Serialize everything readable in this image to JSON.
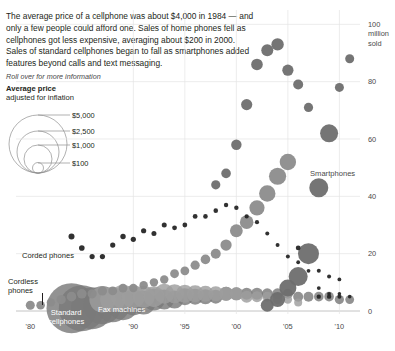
{
  "intro": {
    "paragraph": "The average price of a cellphone was about $4,000 in 1984 — and only a few people could afford one. Sales of home phones fell as cellphones got less expensive, averaging about $200 in 2000. Sales of standard cellphones began to fall as smartphones added features beyond calls and text messaging.",
    "rollover_hint": "Roll over for more information"
  },
  "legend": {
    "title": "Average price",
    "subtitle": "adjusted for inflation",
    "items": [
      {
        "label": "$5,000",
        "value": 5000
      },
      {
        "label": "$2,500",
        "value": 2500
      },
      {
        "label": "$1,000",
        "value": 1000
      },
      {
        "label": "$100",
        "value": 100
      }
    ]
  },
  "annotations": [
    {
      "name": "corded-phones",
      "label": "Corded phones"
    },
    {
      "name": "cordless-phones",
      "label": "Cordless\nphones"
    },
    {
      "name": "standard-cellphones",
      "label": "Standard\ncellphones"
    },
    {
      "name": "fax-machines",
      "label": "Fax machines"
    },
    {
      "name": "smartphones",
      "label": "Smartphones"
    }
  ],
  "colors": {
    "corded": "#262626",
    "cordless": "#8c8c8c",
    "standard_cellphones": "#7a7a7a",
    "fax": "#9e9e9e",
    "smartphones": "#6e6e6e",
    "grid": "#e4e4e4",
    "axis": "#b5b5b5",
    "text": "#231f20"
  },
  "chart_data": {
    "type": "scatter",
    "title": "",
    "xlabel": "",
    "ylabel": "million sold",
    "xlim": [
      1979,
      2012
    ],
    "ylim": [
      0,
      105
    ],
    "grid": true,
    "legend_position": "inline-annotations",
    "xticks": [
      {
        "value": 1980,
        "label": "'80"
      },
      {
        "value": 1990,
        "label": "'90"
      },
      {
        "value": 1995,
        "label": "'95"
      },
      {
        "value": 2000,
        "label": "'00"
      },
      {
        "value": 2005,
        "label": "'05"
      },
      {
        "value": 2010,
        "label": "'10"
      }
    ],
    "yticks": [
      {
        "value": 0,
        "label": "0"
      },
      {
        "value": 20,
        "label": "20"
      },
      {
        "value": 40,
        "label": "40"
      },
      {
        "value": 60,
        "label": "60"
      },
      {
        "value": 80,
        "label": "80"
      },
      {
        "value": 100,
        "label": "100"
      }
    ],
    "y_unit_lines": [
      "100",
      "million",
      "sold"
    ],
    "size_encoding": "average price adjusted for inflation (bubble area)",
    "series": [
      {
        "name": "Corded phones",
        "color": "#262626",
        "points": [
          {
            "x": 1984,
            "y": 26,
            "r": 3.0
          },
          {
            "x": 1985,
            "y": 22,
            "r": 2.8
          },
          {
            "x": 1986,
            "y": 19,
            "r": 2.6
          },
          {
            "x": 1987,
            "y": 19,
            "r": 2.6
          },
          {
            "x": 1988,
            "y": 23,
            "r": 2.6
          },
          {
            "x": 1989,
            "y": 26,
            "r": 2.7
          },
          {
            "x": 1990,
            "y": 25,
            "r": 2.6
          },
          {
            "x": 1991,
            "y": 28,
            "r": 2.6
          },
          {
            "x": 1992,
            "y": 27,
            "r": 2.5
          },
          {
            "x": 1993,
            "y": 30,
            "r": 2.5
          },
          {
            "x": 1994,
            "y": 29,
            "r": 2.4
          },
          {
            "x": 1995,
            "y": 30,
            "r": 2.4
          },
          {
            "x": 1996,
            "y": 33,
            "r": 2.4
          },
          {
            "x": 1997,
            "y": 33,
            "r": 2.3
          },
          {
            "x": 1998,
            "y": 35,
            "r": 2.3
          },
          {
            "x": 1999,
            "y": 37,
            "r": 2.2
          },
          {
            "x": 2000,
            "y": 36,
            "r": 2.2
          },
          {
            "x": 2001,
            "y": 33,
            "r": 2.1
          },
          {
            "x": 2002,
            "y": 31,
            "r": 2.1
          },
          {
            "x": 2003,
            "y": 27,
            "r": 2.0
          },
          {
            "x": 2004,
            "y": 23,
            "r": 2.0
          },
          {
            "x": 2005,
            "y": 19,
            "r": 2.0
          },
          {
            "x": 2006,
            "y": 17,
            "r": 1.9
          },
          {
            "x": 2007,
            "y": 14,
            "r": 1.9
          },
          {
            "x": 2008,
            "y": 8,
            "r": 1.9
          },
          {
            "x": 2009,
            "y": 6,
            "r": 1.9
          },
          {
            "x": 2010,
            "y": 6,
            "r": 1.8
          },
          {
            "x": 2011,
            "y": 5,
            "r": 1.8
          }
        ]
      },
      {
        "name": "Cordless phones",
        "color": "#8c8c8c",
        "points": [
          {
            "x": 1980,
            "y": 2,
            "r": 4.5
          },
          {
            "x": 1981,
            "y": 2,
            "r": 4.3
          },
          {
            "x": 1982,
            "y": 3,
            "r": 4.2
          },
          {
            "x": 1983,
            "y": 4,
            "r": 4.6
          },
          {
            "x": 1984,
            "y": 5,
            "r": 4.8
          },
          {
            "x": 1985,
            "y": 6,
            "r": 4.8
          },
          {
            "x": 1986,
            "y": 6,
            "r": 4.6
          },
          {
            "x": 1987,
            "y": 7,
            "r": 4.6
          },
          {
            "x": 1988,
            "y": 7,
            "r": 4.4
          },
          {
            "x": 1989,
            "y": 8,
            "r": 4.4
          },
          {
            "x": 1990,
            "y": 8,
            "r": 4.2
          },
          {
            "x": 1991,
            "y": 9,
            "r": 4.2
          },
          {
            "x": 1992,
            "y": 10,
            "r": 4.2
          },
          {
            "x": 1993,
            "y": 11,
            "r": 4.2
          },
          {
            "x": 1994,
            "y": 13,
            "r": 4.4
          },
          {
            "x": 1995,
            "y": 14,
            "r": 4.4
          },
          {
            "x": 1996,
            "y": 16,
            "r": 4.6
          },
          {
            "x": 1997,
            "y": 18,
            "r": 4.8
          },
          {
            "x": 1998,
            "y": 20,
            "r": 5.0
          },
          {
            "x": 1999,
            "y": 23,
            "r": 5.6
          },
          {
            "x": 2000,
            "y": 28,
            "r": 6.4
          },
          {
            "x": 2001,
            "y": 31,
            "r": 6.8
          },
          {
            "x": 2002,
            "y": 36,
            "r": 7.6
          },
          {
            "x": 2003,
            "y": 41,
            "r": 8.2
          },
          {
            "x": 2004,
            "y": 47,
            "r": 8.6
          },
          {
            "x": 2005,
            "y": 52,
            "r": 8.2
          }
        ]
      },
      {
        "name": "Standard cellphones",
        "color": "#7a7a7a",
        "points": [
          {
            "x": 1984,
            "y": 1,
            "r": 25
          },
          {
            "x": 1985,
            "y": 1,
            "r": 23
          },
          {
            "x": 1986,
            "y": 1,
            "r": 21
          },
          {
            "x": 1987,
            "y": 2,
            "r": 19
          },
          {
            "x": 1988,
            "y": 2,
            "r": 17
          },
          {
            "x": 1989,
            "y": 2,
            "r": 15
          },
          {
            "x": 1990,
            "y": 3,
            "r": 13
          },
          {
            "x": 1991,
            "y": 3,
            "r": 12
          },
          {
            "x": 1992,
            "y": 4,
            "r": 11
          },
          {
            "x": 1993,
            "y": 4,
            "r": 10
          },
          {
            "x": 1994,
            "y": 4,
            "r": 9
          },
          {
            "x": 1995,
            "y": 5,
            "r": 8.5
          },
          {
            "x": 1996,
            "y": 5,
            "r": 8
          },
          {
            "x": 1997,
            "y": 5,
            "r": 7.5
          },
          {
            "x": 1998,
            "y": 5,
            "r": 7
          },
          {
            "x": 1999,
            "y": 6,
            "r": 7
          },
          {
            "x": 2000,
            "y": 6,
            "r": 6.5
          },
          {
            "x": 2001,
            "y": 6,
            "r": 6
          },
          {
            "x": 2002,
            "y": 6,
            "r": 6
          },
          {
            "x": 2003,
            "y": 6,
            "r": 5.5
          },
          {
            "x": 2004,
            "y": 6,
            "r": 5.5
          },
          {
            "x": 2005,
            "y": 6,
            "r": 5
          },
          {
            "x": 2006,
            "y": 5,
            "r": 5
          },
          {
            "x": 2007,
            "y": 5,
            "r": 5
          },
          {
            "x": 2008,
            "y": 5,
            "r": 4.8
          },
          {
            "x": 2009,
            "y": 5,
            "r": 4.8
          },
          {
            "x": 2010,
            "y": 4,
            "r": 4.6
          },
          {
            "x": 2011,
            "y": 4,
            "r": 4.4
          }
        ]
      },
      {
        "name": "Fax machines",
        "color": "#9e9e9e",
        "points": [
          {
            "x": 1987,
            "y": 4,
            "r": 13
          },
          {
            "x": 1988,
            "y": 4,
            "r": 12.5
          },
          {
            "x": 1989,
            "y": 5,
            "r": 12
          },
          {
            "x": 1990,
            "y": 5,
            "r": 11.5
          },
          {
            "x": 1991,
            "y": 5,
            "r": 11
          },
          {
            "x": 1992,
            "y": 5,
            "r": 10.5
          },
          {
            "x": 1993,
            "y": 6,
            "r": 10
          },
          {
            "x": 1994,
            "y": 6,
            "r": 9.5
          },
          {
            "x": 1995,
            "y": 6,
            "r": 9
          },
          {
            "x": 1996,
            "y": 6,
            "r": 8.5
          },
          {
            "x": 1997,
            "y": 6,
            "r": 8
          },
          {
            "x": 1998,
            "y": 6,
            "r": 7.5
          },
          {
            "x": 1999,
            "y": 6,
            "r": 7
          },
          {
            "x": 2000,
            "y": 6,
            "r": 6.5
          },
          {
            "x": 2001,
            "y": 5,
            "r": 6
          },
          {
            "x": 2002,
            "y": 5,
            "r": 5.5
          },
          {
            "x": 2003,
            "y": 5,
            "r": 5
          },
          {
            "x": 2004,
            "y": 4,
            "r": 4.6
          },
          {
            "x": 2005,
            "y": 4,
            "r": 4.2
          },
          {
            "x": 2006,
            "y": 3,
            "r": 4
          }
        ]
      },
      {
        "name": "Smartphones",
        "color": "#6e6e6e",
        "points": [
          {
            "x": 2003,
            "y": 2,
            "r": 6.5
          },
          {
            "x": 2004,
            "y": 4,
            "r": 7.5
          },
          {
            "x": 2005,
            "y": 8,
            "r": 8.5
          },
          {
            "x": 2006,
            "y": 12,
            "r": 9.5
          },
          {
            "x": 2007,
            "y": 20,
            "r": 10.5
          },
          {
            "x": 2008,
            "y": 43,
            "r": 9.5
          },
          {
            "x": 2009,
            "y": 62,
            "r": 9.0
          },
          {
            "x": 2010,
            "y": 78,
            "r": 4.5
          },
          {
            "x": 2011,
            "y": 88,
            "r": 4.5
          }
        ]
      },
      {
        "name": "Other dark points",
        "color": "#262626",
        "points": [
          {
            "x": 2008,
            "y": 14,
            "r": 2.0
          },
          {
            "x": 2009,
            "y": 12,
            "r": 2.0
          },
          {
            "x": 2010,
            "y": 11,
            "r": 1.9
          },
          {
            "x": 2008,
            "y": 5,
            "r": 2.2
          },
          {
            "x": 2009,
            "y": 5,
            "r": 2.2
          },
          {
            "x": 2010,
            "y": 5,
            "r": 2.0
          },
          {
            "x": 2006,
            "y": 22,
            "r": 2.4
          }
        ]
      },
      {
        "name": "Upper arc cellphone sales",
        "color": "#6e6e6e",
        "points": [
          {
            "x": 2000,
            "y": 58,
            "r": 5.2
          },
          {
            "x": 2001,
            "y": 72,
            "r": 5.6
          },
          {
            "x": 2002,
            "y": 86,
            "r": 5.8
          },
          {
            "x": 2003,
            "y": 91,
            "r": 6.0
          },
          {
            "x": 2004,
            "y": 93,
            "r": 6.2
          },
          {
            "x": 2005,
            "y": 84,
            "r": 5.6
          },
          {
            "x": 2006,
            "y": 79,
            "r": 5.0
          },
          {
            "x": 2007,
            "y": 71,
            "r": 4.6
          },
          {
            "x": 1998,
            "y": 44,
            "r": 4.6
          },
          {
            "x": 1999,
            "y": 48,
            "r": 4.8
          }
        ]
      }
    ]
  }
}
